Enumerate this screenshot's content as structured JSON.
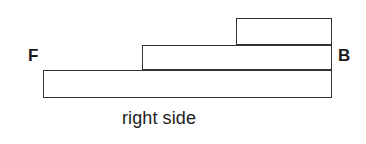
{
  "figure": {
    "title": "right side",
    "caption": "right side",
    "background_color": "#ffffff",
    "line_color": "#333333",
    "text_color": "#1a1a1a",
    "labels": {
      "front": "F",
      "back": "B"
    },
    "blocks": [
      {
        "name": "bottom-tier",
        "tier": 1,
        "x": 43,
        "y": 70,
        "width": 289,
        "height": 28
      },
      {
        "name": "middle-tier",
        "tier": 2,
        "x": 142,
        "y": 45,
        "width": 190,
        "height": 25
      },
      {
        "name": "top-tier",
        "tier": 3,
        "x": 236,
        "y": 18,
        "width": 96,
        "height": 27
      }
    ]
  }
}
